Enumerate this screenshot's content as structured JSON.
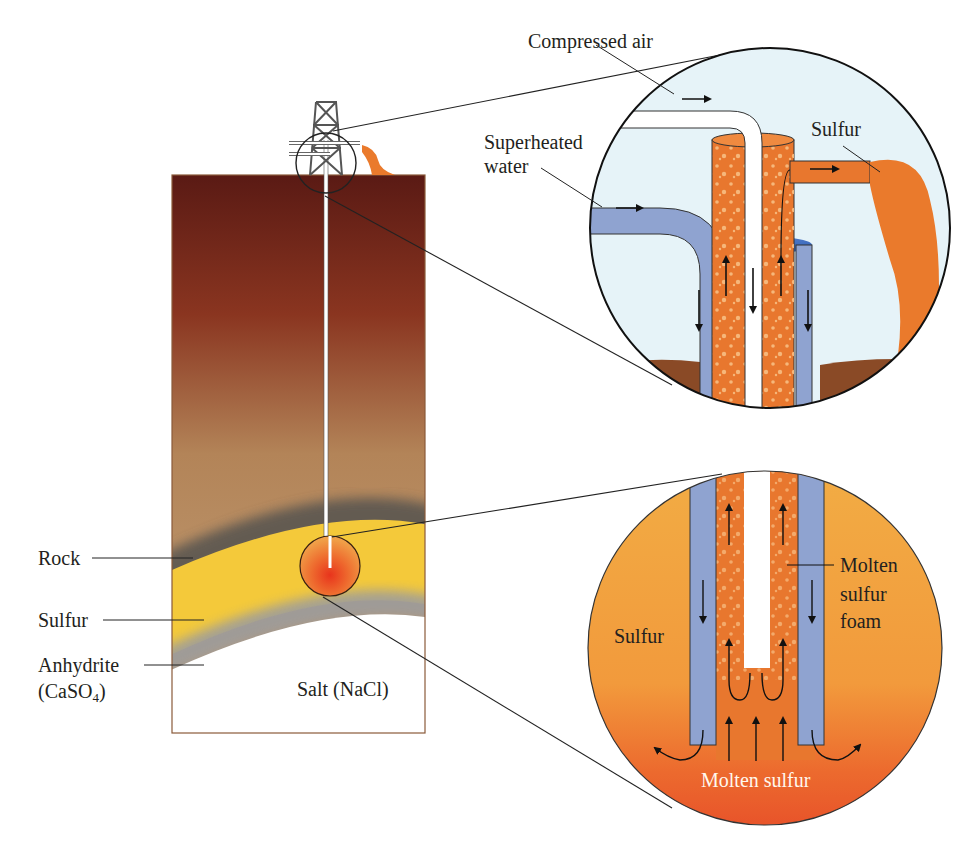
{
  "figure": {
    "cross_section": {
      "layers": [
        {
          "name": "Rock",
          "label": "Rock",
          "color": "#5f5a55"
        },
        {
          "name": "Sulfur",
          "label": "Sulfur",
          "color": "#f4c93a"
        },
        {
          "name": "Anhydrite",
          "label": "Anhydrite",
          "formula_label": "(CaSO",
          "formula_sub": "4",
          "formula_close": ")",
          "color": "#9a9a9a"
        },
        {
          "name": "Salt",
          "label": "Salt (NaCl)",
          "color": "#ffffff"
        }
      ],
      "overburden_gradient": [
        "#5a1a14",
        "#8c3a22",
        "#b98c63",
        "#c7a47a"
      ]
    },
    "upper_inset": {
      "labels": {
        "compressed_air": "Compressed air",
        "superheated_water_line1": "Superheated",
        "superheated_water_line2": "water",
        "sulfur_out": "Sulfur"
      },
      "colors": {
        "water_pipe": "#8fa3d0",
        "sulfur_pipe": "#e8772e",
        "air_pipe": "#ffffff",
        "background": "#e6f3f8",
        "ground": "#8a4a26"
      }
    },
    "lower_inset": {
      "labels": {
        "sulfur": "Sulfur",
        "foam_line1": "Molten",
        "foam_line2": "sulfur",
        "foam_line3": "foam",
        "molten_sulfur": "Molten sulfur"
      },
      "colors": {
        "background": "#f2a540",
        "bottom": "#e8582a",
        "water_pipe": "#8fa3d0",
        "foam": "#e8772e"
      }
    }
  }
}
